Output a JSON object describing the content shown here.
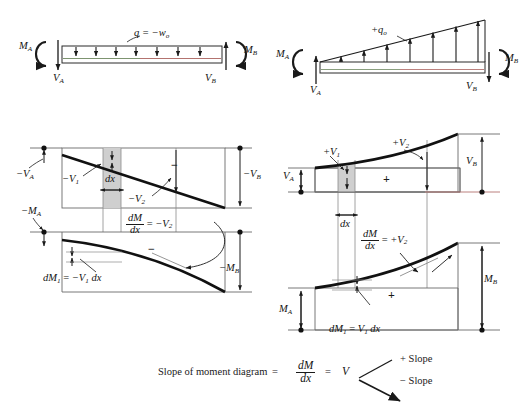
{
  "figure": {
    "type": "beam-shear-moment-diagrams",
    "caption": {
      "text": "Slope of moment diagram",
      "equals_1": "=",
      "fraction_num": "dM",
      "fraction_den": "dx",
      "equals_2": "=",
      "result": "V",
      "plus_slope": "+ Slope",
      "minus_slope": "− Slope"
    },
    "colors": {
      "ink": "#1a1a1a",
      "curve": "#111111",
      "shade": "#c9c9c9",
      "thin_red": "#b3736f",
      "thin_green": "#7d9470",
      "axis": "#5a5a5a"
    }
  },
  "panels": {
    "beam_left": {
      "name": "Uniform downward distributed load beam",
      "load_label": "q = −w",
      "load_label_sub": "o",
      "moment_left": "M",
      "moment_left_sub": "A",
      "moment_right": "M",
      "moment_right_sub": "B",
      "shear_left": "V",
      "shear_left_sub": "A",
      "shear_right": "V",
      "shear_right_sub": "B",
      "arrow_count": 7,
      "arrow_direction": "down"
    },
    "beam_right": {
      "name": "Triangular upward distributed load beam",
      "load_label": "+q",
      "load_label_sub": "o",
      "moment_left": "M",
      "moment_left_sub": "A",
      "moment_right": "M",
      "moment_right_sub": "B",
      "shear_left": "V",
      "shear_left_sub": "A",
      "shear_right": "V",
      "shear_right_sub": "B",
      "arrow_count": 7,
      "arrow_direction": "up"
    },
    "shear_left": {
      "name": "Negative shear diagram (linear descending)",
      "v_a": "−V",
      "v_a_sub": "A",
      "v_1": "−V",
      "v_1_sub": "1",
      "v_2": "−V",
      "v_2_sub": "2",
      "v_b": "−V",
      "v_b_sub": "B",
      "dx": "dx",
      "sign": "−"
    },
    "moment_left": {
      "name": "Negative moment diagram (concave down)",
      "m_a": "−M",
      "m_a_sub": "A",
      "m_b": "−M",
      "m_b_sub": "B",
      "slope_rel_num": "dM",
      "slope_rel_den": "dx",
      "slope_rel_eq": "=",
      "slope_rel_rhs": "−V",
      "slope_rel_rhs_sub": "2",
      "dm1": "dM",
      "dm1_sub": "1",
      "dm1_eq": "=",
      "dm1_rhs": "−V",
      "dm1_rhs_sub": "1",
      "dm1_tail": "dx",
      "sign": "−"
    },
    "shear_right": {
      "name": "Positive shear diagram (parabolic rising)",
      "v_a": "V",
      "v_a_sub": "A",
      "v_1": "+V",
      "v_1_sub": "1",
      "v_2": "+V",
      "v_2_sub": "2",
      "v_b": "V",
      "v_b_sub": "B",
      "dx": "dx",
      "sign": "+"
    },
    "moment_right": {
      "name": "Positive moment diagram (concave up)",
      "m_a": "M",
      "m_a_sub": "A",
      "m_b": "M",
      "m_b_sub": "B",
      "slope_rel_num": "dM",
      "slope_rel_den": "dx",
      "slope_rel_eq": "=",
      "slope_rel_rhs": "+V",
      "slope_rel_rhs_sub": "2",
      "dm1": "dM",
      "dm1_sub": "1",
      "dm1_eq": "=",
      "dm1_rhs": "V",
      "dm1_rhs_sub": "1",
      "dm1_tail": "dx",
      "sign": "+"
    }
  }
}
